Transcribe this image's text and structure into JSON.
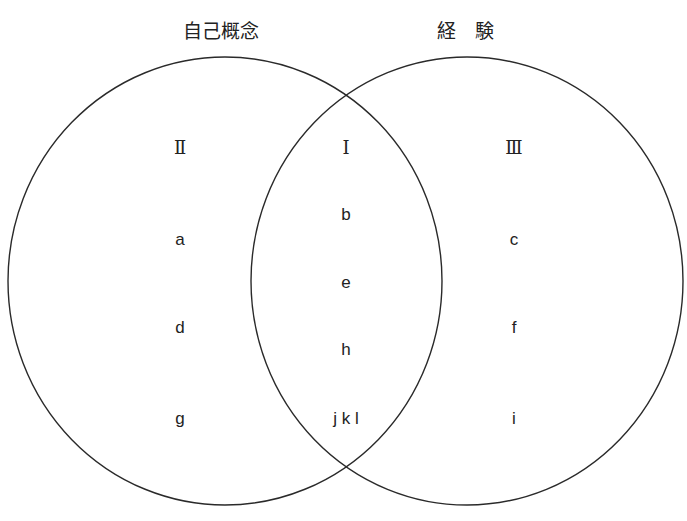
{
  "titles": {
    "left": "自己概念",
    "right": "経　験"
  },
  "regions": {
    "left_only": {
      "numeral": "Ⅱ",
      "items": [
        "a",
        "d",
        "g"
      ]
    },
    "intersection": {
      "numeral": "Ⅰ",
      "items": [
        "b",
        "e",
        "h",
        "j k l"
      ]
    },
    "right_only": {
      "numeral": "Ⅲ",
      "items": [
        "c",
        "f",
        "i"
      ]
    }
  },
  "colors": {
    "stroke": "#2a2a2a",
    "text": "#222222",
    "background": "#ffffff"
  }
}
